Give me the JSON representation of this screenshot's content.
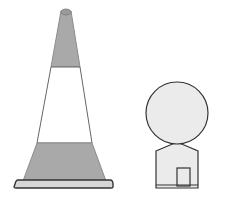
{
  "illustration": {
    "description": "Line drawing of a traffic cone beside a round-headed post figure",
    "objects": [
      {
        "name": "traffic-cone",
        "bands": [
          "gray",
          "white",
          "gray"
        ]
      },
      {
        "name": "round-sign-post",
        "parts": [
          "circular-head",
          "body",
          "door"
        ]
      }
    ],
    "colors": {
      "stroke": "#333333",
      "cone_gray": "#a9a9a9",
      "cone_white": "#ffffff",
      "base_fill": "#d6d6d6",
      "post_fill": "#ebebeb"
    }
  }
}
